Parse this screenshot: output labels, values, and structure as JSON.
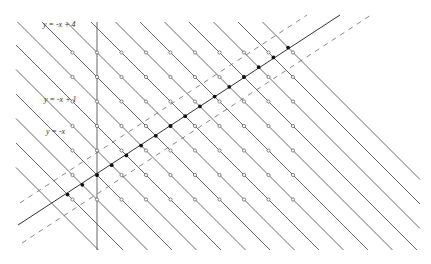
{
  "diagram": {
    "origin_px": [
      97,
      175
    ],
    "unit_px": 24.5,
    "colors": {
      "line": "#555555",
      "dashed": "#666666",
      "point_open_stroke": "#555555",
      "point_filled": "#111111",
      "background": "#ffffff"
    },
    "labels": [
      {
        "text": "y = -x + 4",
        "x": 43,
        "y": 26
      },
      {
        "text": "y = -x + 1",
        "x": 44,
        "y": 101
      },
      {
        "text": "y = -x",
        "x": 46,
        "y": 133
      }
    ],
    "vertical_axis": {
      "x": 97,
      "y1": 22,
      "y2": 250
    },
    "solid_line": {
      "equation": "y = 2x/3",
      "x1": 18,
      "y1": 225,
      "x2": 340,
      "y2": 15
    },
    "dashed_lines": [
      {
        "x1": 20,
        "y1": 203,
        "x2": 307,
        "y2": 15
      },
      {
        "x1": 22,
        "y1": 243,
        "x2": 371,
        "y2": 15
      }
    ],
    "diagonal_family": {
      "equation": "y = -x + k",
      "k_min": -3,
      "k_max": 13,
      "top_y": 22,
      "bottom_y": 250,
      "left_x": 16,
      "right_x": 420
    },
    "grid_points": {
      "x_range": [
        -1,
        8
      ],
      "y_range": [
        -1,
        5
      ],
      "style": "open-circle"
    },
    "filled_points": {
      "on_line": "y = 2x/3",
      "k_range": [
        -2,
        13
      ],
      "style": "filled-dot"
    }
  }
}
